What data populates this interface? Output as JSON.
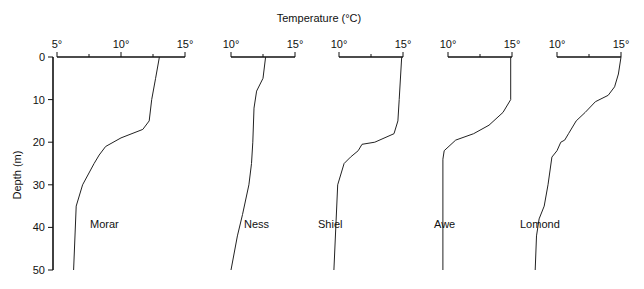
{
  "chart_data": {
    "type": "line",
    "title": "",
    "xlabel": "Temperature (°C)",
    "ylabel": "Depth (m)",
    "y_ticks": [
      0,
      10,
      20,
      30,
      40,
      50
    ],
    "ylim": [
      0,
      50
    ],
    "y_inverted": true,
    "grid": false,
    "legend": "inline panel labels",
    "panels": [
      {
        "name": "Morar",
        "xlim": [
          5,
          15
        ],
        "x_ticks": [
          5,
          10,
          15
        ],
        "x_tick_labels": [
          "5°",
          "10°",
          "15°"
        ],
        "minor_ticks": [
          7.5,
          12.5
        ],
        "points": [
          [
            13.0,
            0
          ],
          [
            12.7,
            5
          ],
          [
            12.4,
            10
          ],
          [
            12.2,
            15
          ],
          [
            11.7,
            17
          ],
          [
            10.0,
            19
          ],
          [
            8.8,
            21
          ],
          [
            8.3,
            23
          ],
          [
            7.9,
            25
          ],
          [
            7.0,
            30
          ],
          [
            6.5,
            35
          ],
          [
            6.3,
            50
          ]
        ]
      },
      {
        "name": "Ness",
        "xlim": [
          10,
          15
        ],
        "x_ticks": [
          10,
          15
        ],
        "x_tick_labels": [
          "10°",
          "15°"
        ],
        "minor_ticks": [
          12.5
        ],
        "points": [
          [
            12.7,
            0
          ],
          [
            12.5,
            5
          ],
          [
            12.0,
            8
          ],
          [
            11.8,
            12
          ],
          [
            11.7,
            20
          ],
          [
            11.6,
            25
          ],
          [
            11.4,
            30
          ],
          [
            10.9,
            37
          ],
          [
            10.5,
            42
          ],
          [
            10.0,
            50
          ]
        ]
      },
      {
        "name": "Shiel",
        "xlim": [
          10,
          15
        ],
        "x_ticks": [
          10,
          15
        ],
        "x_tick_labels": [
          "10°",
          "15°"
        ],
        "minor_ticks": [
          12.5
        ],
        "points": [
          [
            14.9,
            0
          ],
          [
            14.7,
            10
          ],
          [
            14.6,
            15
          ],
          [
            14.3,
            18
          ],
          [
            12.8,
            20
          ],
          [
            11.8,
            20.5
          ],
          [
            11.5,
            22
          ],
          [
            10.9,
            23.5
          ],
          [
            10.4,
            25
          ],
          [
            9.9,
            30
          ],
          [
            9.6,
            50
          ]
        ]
      },
      {
        "name": "Awe",
        "xlim": [
          10,
          15
        ],
        "x_ticks": [
          10,
          15
        ],
        "x_tick_labels": [
          "10°",
          "15°"
        ],
        "minor_ticks": [
          12.5
        ],
        "points": [
          [
            14.9,
            0
          ],
          [
            14.9,
            10
          ],
          [
            14.3,
            13
          ],
          [
            13.2,
            16
          ],
          [
            12.0,
            18
          ],
          [
            10.6,
            19.5
          ],
          [
            9.7,
            22
          ],
          [
            9.6,
            24
          ],
          [
            9.6,
            50
          ]
        ]
      },
      {
        "name": "Lomond",
        "xlim": [
          10,
          15
        ],
        "x_ticks": [
          10,
          15
        ],
        "x_tick_labels": [
          "10°",
          "15°"
        ],
        "minor_ticks": [
          12.5
        ],
        "points": [
          [
            15.0,
            0
          ],
          [
            14.8,
            4
          ],
          [
            14.5,
            7
          ],
          [
            14.0,
            9
          ],
          [
            13.0,
            10.5
          ],
          [
            12.2,
            13
          ],
          [
            11.5,
            15
          ],
          [
            10.9,
            18
          ],
          [
            10.6,
            19.5
          ],
          [
            10.3,
            20
          ],
          [
            10.0,
            22
          ],
          [
            9.6,
            23.5
          ],
          [
            9.3,
            30
          ],
          [
            9.0,
            35
          ],
          [
            8.6,
            38
          ],
          [
            8.4,
            42
          ],
          [
            8.3,
            50
          ]
        ]
      }
    ]
  },
  "labels": {
    "x_axis_title": "Temperature (°C)",
    "y_axis_title": "Depth (m)",
    "depth_ticks": [
      "0",
      "10",
      "20",
      "30",
      "40",
      "50"
    ]
  },
  "layout": {
    "y0": 57,
    "px_per_m": 4.26,
    "px_per_deg": 12.8,
    "panel_origins": [
      {
        "x_at_min": 57,
        "label_x": 90,
        "label_y": 228
      },
      {
        "x_at_min": 231,
        "label_x": 244,
        "label_y": 228
      },
      {
        "x_at_min": 339,
        "label_x": 318,
        "label_y": 228
      },
      {
        "x_at_min": 448,
        "label_x": 434,
        "label_y": 228
      },
      {
        "x_at_min": 557,
        "label_x": 520,
        "label_y": 228
      }
    ],
    "line_color": "#222222",
    "axis_color": "#111111"
  }
}
